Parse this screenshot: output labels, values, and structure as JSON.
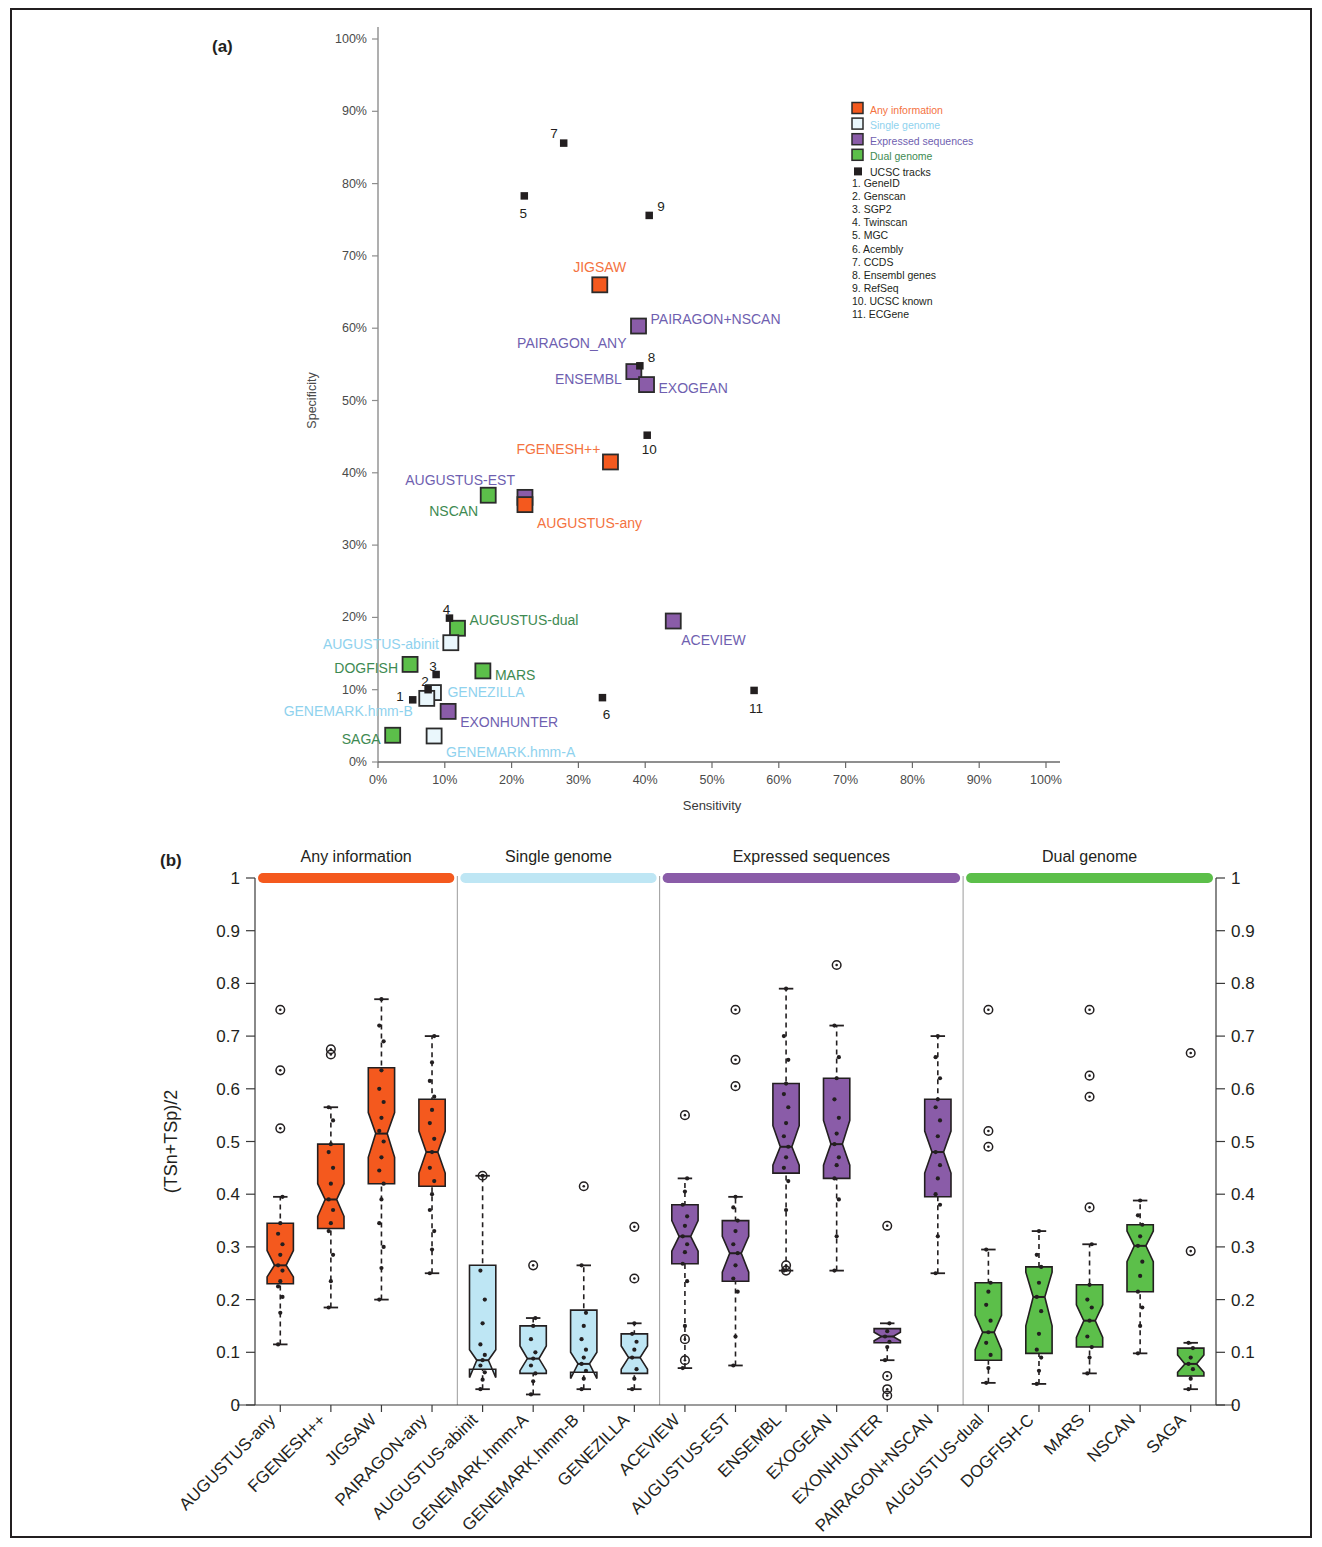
{
  "figure": {
    "panel_a_tag": "(a)",
    "panel_b_tag": "(b)"
  },
  "chart_data": [
    {
      "type": "scatter",
      "panel": "(a)",
      "title": "",
      "xlabel": "Sensitivity",
      "ylabel": "Specificity",
      "xlim": [
        0,
        100
      ],
      "ylim": [
        0,
        100
      ],
      "xticks": [
        "0%",
        "10%",
        "20%",
        "30%",
        "40%",
        "50%",
        "60%",
        "70%",
        "80%",
        "90%",
        "100%"
      ],
      "yticks": [
        "0%",
        "10%",
        "20%",
        "30%",
        "40%",
        "50%",
        "60%",
        "70%",
        "80%",
        "90%",
        "100%"
      ],
      "grid": false,
      "legend_position": "top-right",
      "legend": [
        {
          "label": "Any information",
          "color": "#F4591E",
          "style": "filled"
        },
        {
          "label": "Single genome",
          "color": "#ADE0F2",
          "style": "open"
        },
        {
          "label": "Expressed sequences",
          "color": "#8A5CA8",
          "style": "filled"
        },
        {
          "label": "Dual genome",
          "color": "#5CBF4A",
          "style": "filled"
        },
        {
          "label": "UCSC tracks",
          "color": "#231f20",
          "style": "small"
        }
      ],
      "ucsc_track_key": [
        "1. GeneID",
        "2. Genscan",
        "3. SGP2",
        "4. Twinscan",
        "5. MGC",
        "6. Acembly",
        "7. CCDS",
        "8. Ensembl genes",
        "9. RefSeq",
        "10. UCSC known",
        "11. ECGene"
      ],
      "points": [
        {
          "name": "JIGSAW",
          "x": 33.2,
          "y": 66.0,
          "group": "Any information",
          "label_dx": 0,
          "label_dy": -17,
          "anchor": "middle"
        },
        {
          "name": "PAIRAGON_ANY",
          "x": 39.0,
          "y": 60.3,
          "group": "Expressed sequences",
          "label_dx": -12,
          "label_dy": 18,
          "anchor": "end",
          "label_is_other": true
        },
        {
          "name": "PAIRAGON+NSCAN",
          "x": 39.0,
          "y": 60.3,
          "group": "Expressed sequences",
          "label_dx": 12,
          "label_dy": -6,
          "anchor": "start"
        },
        {
          "name": "ENSEMBL",
          "x": 38.3,
          "y": 54.0,
          "group": "Expressed sequences",
          "label_dx": -12,
          "label_dy": 8,
          "anchor": "end"
        },
        {
          "name": "EXOGEAN",
          "x": 40.2,
          "y": 52.2,
          "group": "Expressed sequences",
          "label_dx": 12,
          "label_dy": 4,
          "anchor": "start"
        },
        {
          "name": "FGENESH++",
          "x": 34.8,
          "y": 41.5,
          "group": "Any information",
          "label_dx": -10,
          "label_dy": -12,
          "anchor": "end"
        },
        {
          "name": "AUGUSTUS-EST",
          "x": 22.0,
          "y": 36.6,
          "group": "Expressed sequences",
          "label_dx": -10,
          "label_dy": -16,
          "anchor": "end"
        },
        {
          "name": "AUGUSTUS-any",
          "x": 22.0,
          "y": 35.6,
          "group": "Any information",
          "label_dx": 12,
          "label_dy": 19,
          "anchor": "start"
        },
        {
          "name": "NSCAN",
          "x": 16.5,
          "y": 36.9,
          "group": "Dual genome",
          "label_dx": -10,
          "label_dy": 17,
          "anchor": "end"
        },
        {
          "name": "ACEVIEW",
          "x": 44.2,
          "y": 19.5,
          "group": "Expressed sequences",
          "label_dx": 8,
          "label_dy": 20,
          "anchor": "start"
        },
        {
          "name": "AUGUSTUS-dual",
          "x": 11.9,
          "y": 18.5,
          "group": "Dual genome",
          "label_dx": 12,
          "label_dy": -7,
          "anchor": "start"
        },
        {
          "name": "AUGUSTUS-abinit",
          "x": 10.9,
          "y": 16.5,
          "group": "Single genome",
          "label_dx": -12,
          "label_dy": 2,
          "anchor": "end"
        },
        {
          "name": "DOGFISH",
          "x": 4.8,
          "y": 13.5,
          "group": "Dual genome",
          "label_dx": -12,
          "label_dy": 5,
          "anchor": "end"
        },
        {
          "name": "MARS",
          "x": 15.7,
          "y": 12.6,
          "group": "Dual genome",
          "label_dx": 12,
          "label_dy": 5,
          "anchor": "start"
        },
        {
          "name": "GENEZILLA",
          "x": 8.3,
          "y": 9.6,
          "group": "Single genome",
          "label_dx": 14,
          "label_dy": 0,
          "anchor": "start"
        },
        {
          "name": "GENEMARK.hmm-B",
          "x": 7.3,
          "y": 8.8,
          "group": "Single genome",
          "label_dx": -14,
          "label_dy": 14,
          "anchor": "end"
        },
        {
          "name": "EXONHUNTER",
          "x": 10.5,
          "y": 7.0,
          "group": "Expressed sequences",
          "label_dx": 12,
          "label_dy": 12,
          "anchor": "start"
        },
        {
          "name": "GENEMARK.hmm-A",
          "x": 8.4,
          "y": 3.6,
          "group": "Single genome",
          "label_dx": 12,
          "label_dy": 17,
          "anchor": "start"
        },
        {
          "name": "SAGA",
          "x": 2.2,
          "y": 3.7,
          "group": "Dual genome",
          "label_dx": -12,
          "label_dy": 5,
          "anchor": "end"
        }
      ],
      "ucsc_points": [
        {
          "n": "7",
          "x": 27.8,
          "y": 85.6,
          "label_dx": -6,
          "label_dy": -9,
          "anchor": "end"
        },
        {
          "n": "5",
          "x": 21.9,
          "y": 78.3,
          "label_dx": -1,
          "label_dy": 18,
          "anchor": "middle"
        },
        {
          "n": "9",
          "x": 40.6,
          "y": 75.6,
          "label_dx": 8,
          "label_dy": -8,
          "anchor": "start"
        },
        {
          "n": "8",
          "x": 39.2,
          "y": 54.8,
          "label_dx": 8,
          "label_dy": -8,
          "anchor": "start"
        },
        {
          "n": "10",
          "x": 40.3,
          "y": 45.2,
          "label_dx": 2,
          "label_dy": 15,
          "anchor": "middle"
        },
        {
          "n": "4",
          "x": 10.7,
          "y": 19.9,
          "label_dx": -3,
          "label_dy": -8,
          "anchor": "middle"
        },
        {
          "n": "3",
          "x": 8.7,
          "y": 12.1,
          "label_dx": -3,
          "label_dy": -8,
          "anchor": "middle"
        },
        {
          "n": "2",
          "x": 7.5,
          "y": 10.0,
          "label_dx": -3,
          "label_dy": -8,
          "anchor": "middle"
        },
        {
          "n": "1",
          "x": 5.2,
          "y": 8.6,
          "label_dx": -9,
          "label_dy": -3,
          "anchor": "end"
        },
        {
          "n": "6",
          "x": 33.6,
          "y": 8.9,
          "label_dx": 4,
          "label_dy": 17,
          "anchor": "middle"
        },
        {
          "n": "11",
          "x": 56.3,
          "y": 9.9,
          "label_dx": 2,
          "label_dy": 19,
          "anchor": "middle"
        }
      ]
    },
    {
      "type": "boxplot",
      "panel": "(b)",
      "title": "",
      "xlabel": "",
      "ylabel": "(TSn+TSp)/2",
      "ylim": [
        0,
        1
      ],
      "yticks": [
        "0",
        "0.1",
        "0.2",
        "0.3",
        "0.4",
        "0.5",
        "0.6",
        "0.7",
        "0.8",
        "0.9",
        "1"
      ],
      "grid": false,
      "groups": [
        {
          "label": "Any information",
          "color": "#F4591E",
          "count": 4
        },
        {
          "label": "Single genome",
          "color": "#BEE6F4",
          "count": 4
        },
        {
          "label": "Expressed sequences",
          "color": "#8A5CA8",
          "count": 6
        },
        {
          "label": "Dual genome",
          "color": "#5CBF4A",
          "count": 5
        }
      ],
      "categories": [
        "AUGUSTUS-any",
        "FGENESH++",
        "JIGSAW",
        "PAIRAGON-any",
        "AUGUSTUS-abinit",
        "GENEMARK.hmm-A",
        "GENEMARK.hmm-B",
        "GENEZILLA",
        "ACEVIEW",
        "AUGUSTUS-EST",
        "ENSEMBL",
        "EXOGEAN",
        "EXONHUNTER",
        "PAIRAGON+NSCAN",
        "AUGUSTUS-dual",
        "DOGFISH-C",
        "MARS",
        "NSCAN",
        "SAGA"
      ],
      "boxes": [
        {
          "name": "AUGUSTUS-any",
          "group": 0,
          "low": 0.115,
          "q1": 0.23,
          "med": 0.265,
          "q3": 0.345,
          "high": 0.395,
          "notch_lo": 0.243,
          "notch_hi": 0.293,
          "outliers": [
            0.75,
            0.635,
            0.525
          ],
          "points": [
            0.115,
            0.175,
            0.205,
            0.225,
            0.235,
            0.255,
            0.265,
            0.285,
            0.305,
            0.325,
            0.345,
            0.395
          ]
        },
        {
          "name": "FGENESH++",
          "group": 0,
          "low": 0.185,
          "q1": 0.335,
          "med": 0.39,
          "q3": 0.495,
          "high": 0.565,
          "notch_lo": 0.358,
          "notch_hi": 0.42,
          "outliers": [
            0.675,
            0.665
          ],
          "points": [
            0.185,
            0.235,
            0.285,
            0.33,
            0.345,
            0.37,
            0.39,
            0.42,
            0.45,
            0.48,
            0.495,
            0.54,
            0.565
          ]
        },
        {
          "name": "JIGSAW",
          "group": 0,
          "low": 0.2,
          "q1": 0.42,
          "med": 0.515,
          "q3": 0.64,
          "high": 0.77,
          "notch_lo": 0.47,
          "notch_hi": 0.555,
          "outliers": [],
          "points": [
            0.2,
            0.26,
            0.3,
            0.345,
            0.39,
            0.42,
            0.445,
            0.47,
            0.5,
            0.52,
            0.545,
            0.575,
            0.6,
            0.635,
            0.69,
            0.72,
            0.77
          ]
        },
        {
          "name": "PAIRAGON-any",
          "group": 0,
          "low": 0.25,
          "q1": 0.415,
          "med": 0.48,
          "q3": 0.58,
          "high": 0.7,
          "notch_lo": 0.44,
          "notch_hi": 0.52,
          "outliers": [],
          "points": [
            0.25,
            0.295,
            0.33,
            0.37,
            0.4,
            0.425,
            0.45,
            0.48,
            0.505,
            0.535,
            0.56,
            0.585,
            0.615,
            0.65,
            0.7
          ]
        },
        {
          "name": "AUGUSTUS-abinit",
          "group": 1,
          "low": 0.03,
          "q1": 0.068,
          "med": 0.085,
          "q3": 0.265,
          "high": 0.435,
          "notch_lo": 0.052,
          "notch_hi": 0.105,
          "outliers": [
            0.435
          ],
          "points": [
            0.03,
            0.048,
            0.062,
            0.075,
            0.085,
            0.095,
            0.115,
            0.155,
            0.2,
            0.255,
            0.435
          ]
        },
        {
          "name": "GENEMARK.hmm-A",
          "group": 1,
          "low": 0.02,
          "q1": 0.06,
          "med": 0.088,
          "q3": 0.15,
          "high": 0.165,
          "notch_lo": 0.065,
          "notch_hi": 0.112,
          "outliers": [
            0.265
          ],
          "points": [
            0.02,
            0.045,
            0.06,
            0.075,
            0.088,
            0.1,
            0.125,
            0.15,
            0.165
          ]
        },
        {
          "name": "GENEMARK.hmm-B",
          "group": 1,
          "low": 0.03,
          "q1": 0.062,
          "med": 0.078,
          "q3": 0.18,
          "high": 0.265,
          "notch_lo": 0.05,
          "notch_hi": 0.1,
          "outliers": [
            0.415
          ],
          "points": [
            0.03,
            0.05,
            0.065,
            0.078,
            0.09,
            0.105,
            0.125,
            0.15,
            0.175,
            0.265
          ]
        },
        {
          "name": "GENEZILLA",
          "group": 1,
          "low": 0.03,
          "q1": 0.06,
          "med": 0.09,
          "q3": 0.135,
          "high": 0.155,
          "notch_lo": 0.068,
          "notch_hi": 0.112,
          "outliers": [
            0.338,
            0.24
          ],
          "points": [
            0.03,
            0.05,
            0.068,
            0.09,
            0.105,
            0.12,
            0.135,
            0.155
          ]
        },
        {
          "name": "ACEVIEW",
          "group": 2,
          "low": 0.07,
          "q1": 0.268,
          "med": 0.32,
          "q3": 0.38,
          "high": 0.43,
          "notch_lo": 0.292,
          "notch_hi": 0.35,
          "outliers": [
            0.55,
            0.125,
            0.085
          ],
          "points": [
            0.07,
            0.15,
            0.235,
            0.268,
            0.29,
            0.305,
            0.32,
            0.34,
            0.358,
            0.38,
            0.405,
            0.43
          ]
        },
        {
          "name": "AUGUSTUS-EST",
          "group": 2,
          "low": 0.075,
          "q1": 0.235,
          "med": 0.288,
          "q3": 0.35,
          "high": 0.395,
          "notch_lo": 0.252,
          "notch_hi": 0.32,
          "outliers": [
            0.75,
            0.655,
            0.605
          ],
          "points": [
            0.075,
            0.13,
            0.215,
            0.24,
            0.265,
            0.288,
            0.305,
            0.33,
            0.35,
            0.375,
            0.395
          ]
        },
        {
          "name": "ENSEMBL",
          "group": 2,
          "low": 0.255,
          "q1": 0.44,
          "med": 0.49,
          "q3": 0.61,
          "high": 0.79,
          "notch_lo": 0.455,
          "notch_hi": 0.53,
          "outliers": [
            0.265,
            0.255
          ],
          "points": [
            0.255,
            0.37,
            0.425,
            0.45,
            0.47,
            0.49,
            0.51,
            0.535,
            0.565,
            0.59,
            0.61,
            0.655,
            0.7,
            0.79
          ]
        },
        {
          "name": "EXOGEAN",
          "group": 2,
          "low": 0.255,
          "q1": 0.43,
          "med": 0.495,
          "q3": 0.62,
          "high": 0.72,
          "notch_lo": 0.455,
          "notch_hi": 0.54,
          "outliers": [
            0.835
          ],
          "points": [
            0.255,
            0.32,
            0.39,
            0.43,
            0.455,
            0.47,
            0.495,
            0.515,
            0.545,
            0.58,
            0.62,
            0.66,
            0.72
          ]
        },
        {
          "name": "EXONHUNTER",
          "group": 2,
          "low": 0.085,
          "q1": 0.118,
          "med": 0.13,
          "q3": 0.145,
          "high": 0.155,
          "notch_lo": 0.122,
          "notch_hi": 0.138,
          "outliers": [
            0.34,
            0.055,
            0.03,
            0.018
          ],
          "points": [
            0.085,
            0.11,
            0.12,
            0.13,
            0.14,
            0.155
          ]
        },
        {
          "name": "PAIRAGON+NSCAN",
          "group": 2,
          "low": 0.25,
          "q1": 0.395,
          "med": 0.48,
          "q3": 0.58,
          "high": 0.7,
          "notch_lo": 0.44,
          "notch_hi": 0.52,
          "outliers": [],
          "points": [
            0.25,
            0.32,
            0.38,
            0.4,
            0.43,
            0.455,
            0.48,
            0.51,
            0.54,
            0.565,
            0.58,
            0.62,
            0.66,
            0.7
          ]
        },
        {
          "name": "AUGUSTUS-dual",
          "group": 3,
          "low": 0.042,
          "q1": 0.085,
          "med": 0.138,
          "q3": 0.232,
          "high": 0.295,
          "notch_lo": 0.105,
          "notch_hi": 0.17,
          "outliers": [
            0.75,
            0.52,
            0.49
          ],
          "points": [
            0.042,
            0.07,
            0.095,
            0.118,
            0.138,
            0.16,
            0.19,
            0.215,
            0.232,
            0.295
          ]
        },
        {
          "name": "DOGFISH-C",
          "group": 3,
          "low": 0.04,
          "q1": 0.098,
          "med": 0.205,
          "q3": 0.262,
          "high": 0.33,
          "notch_lo": 0.15,
          "notch_hi": 0.252,
          "outliers": [],
          "points": [
            0.04,
            0.065,
            0.09,
            0.105,
            0.135,
            0.178,
            0.205,
            0.232,
            0.262,
            0.285,
            0.33
          ]
        },
        {
          "name": "MARS",
          "group": 3,
          "low": 0.06,
          "q1": 0.11,
          "med": 0.16,
          "q3": 0.228,
          "high": 0.305,
          "notch_lo": 0.128,
          "notch_hi": 0.19,
          "outliers": [
            0.375,
            0.625,
            0.585,
            0.75
          ],
          "points": [
            0.06,
            0.09,
            0.11,
            0.13,
            0.16,
            0.185,
            0.2,
            0.228,
            0.305
          ]
        },
        {
          "name": "NSCAN",
          "group": 3,
          "low": 0.098,
          "q1": 0.215,
          "med": 0.302,
          "q3": 0.342,
          "high": 0.388,
          "notch_lo": 0.272,
          "notch_hi": 0.33,
          "outliers": [],
          "points": [
            0.098,
            0.15,
            0.185,
            0.215,
            0.245,
            0.272,
            0.302,
            0.32,
            0.342,
            0.36,
            0.388
          ]
        },
        {
          "name": "SAGA",
          "group": 3,
          "low": 0.03,
          "q1": 0.055,
          "med": 0.078,
          "q3": 0.108,
          "high": 0.118,
          "notch_lo": 0.062,
          "notch_hi": 0.095,
          "outliers": [
            0.292,
            0.668
          ],
          "points": [
            0.03,
            0.05,
            0.068,
            0.078,
            0.09,
            0.108,
            0.118
          ]
        }
      ]
    }
  ]
}
